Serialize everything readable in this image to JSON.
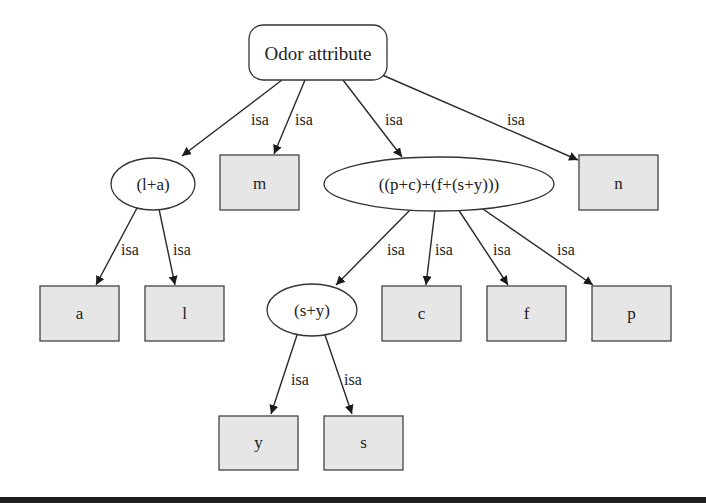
{
  "diagram": {
    "colors": {
      "box_fill": "#e6e6e6",
      "stroke": "#333333",
      "background": "#ffffff",
      "bottom_bar": "#1e1e1e"
    },
    "nodes": {
      "root": {
        "label": "Odor attribute",
        "shape": "rounded-rect"
      },
      "la": {
        "label": "(l+a)",
        "shape": "ellipse"
      },
      "m": {
        "label": "m",
        "shape": "box"
      },
      "pcfsy": {
        "label": "((p+c)+(f+(s+y)))",
        "shape": "ellipse"
      },
      "n": {
        "label": "n",
        "shape": "box"
      },
      "a": {
        "label": "a",
        "shape": "box"
      },
      "l": {
        "label": "l",
        "shape": "box"
      },
      "sy": {
        "label": "(s+y)",
        "shape": "ellipse"
      },
      "c": {
        "label": "c",
        "shape": "box"
      },
      "f": {
        "label": "f",
        "shape": "box"
      },
      "p": {
        "label": "p",
        "shape": "box"
      },
      "y": {
        "label": "y",
        "shape": "box"
      },
      "s": {
        "label": "s",
        "shape": "box"
      }
    },
    "edges": [
      {
        "from": "Odor attribute",
        "to": "(l+a)",
        "label": "isa"
      },
      {
        "from": "Odor attribute",
        "to": "m",
        "label": "isa"
      },
      {
        "from": "Odor attribute",
        "to": "((p+c)+(f+(s+y)))",
        "label": "isa"
      },
      {
        "from": "Odor attribute",
        "to": "n",
        "label": "isa"
      },
      {
        "from": "(l+a)",
        "to": "a",
        "label": "isa"
      },
      {
        "from": "(l+a)",
        "to": "l",
        "label": "isa"
      },
      {
        "from": "((p+c)+(f+(s+y)))",
        "to": "(s+y)",
        "label": "isa"
      },
      {
        "from": "((p+c)+(f+(s+y)))",
        "to": "c",
        "label": "isa"
      },
      {
        "from": "((p+c)+(f+(s+y)))",
        "to": "f",
        "label": "isa"
      },
      {
        "from": "((p+c)+(f+(s+y)))",
        "to": "p",
        "label": "isa"
      },
      {
        "from": "(s+y)",
        "to": "y",
        "label": "isa"
      },
      {
        "from": "(s+y)",
        "to": "s",
        "label": "isa"
      }
    ]
  }
}
